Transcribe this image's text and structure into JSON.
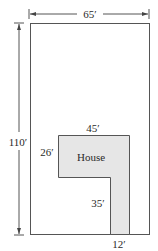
{
  "diagram": {
    "type": "floor-plan",
    "lot": {
      "width_label": "65′",
      "height_label": "110′",
      "width_ft": 65,
      "height_ft": 110
    },
    "house": {
      "label": "House",
      "top_width_label": "45′",
      "top_depth_label": "26′",
      "leg_length_label": "35′",
      "leg_width_label": "12′",
      "top_width_ft": 45,
      "top_depth_ft": 26,
      "leg_length_ft": 35,
      "leg_width_ft": 12,
      "fill_color": "#e6e6e6"
    },
    "colors": {
      "line": "#555555",
      "text": "#2a2a2a",
      "background": "#ffffff"
    }
  }
}
